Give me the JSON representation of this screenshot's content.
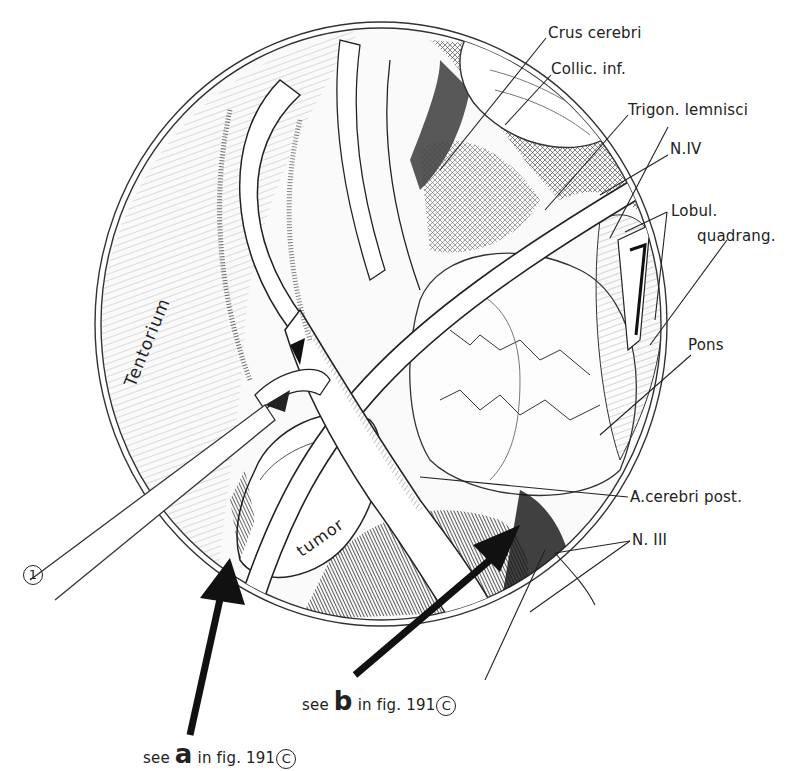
{
  "figure": {
    "type": "surgical anatomical illustration",
    "view": "circular operative field",
    "colors": {
      "ink": "#1a1a1a",
      "paper": "#ffffff",
      "shade": "#555555"
    }
  },
  "labels": {
    "crus_cerebri": "Crus cerebri",
    "collic_inf": "Collic. inf.",
    "trigon_lemnisci": "Trigon. lemnisci",
    "n_iv": "N.IV",
    "lobul": "Lobul.",
    "quadrang": "quadrang.",
    "pons": "Pons",
    "a_cerebri_post": "A.cerebri post.",
    "n_iii": "N. III",
    "tentorium": "Tentorium",
    "tumor": "tumor",
    "instrument_number": "1"
  },
  "references": {
    "a": {
      "prefix": "see",
      "letter": "a",
      "suffix": "in fig. 191",
      "circled": "C"
    },
    "b": {
      "prefix": "see",
      "letter": "b",
      "suffix": "in fig. 191",
      "circled": "C"
    }
  }
}
